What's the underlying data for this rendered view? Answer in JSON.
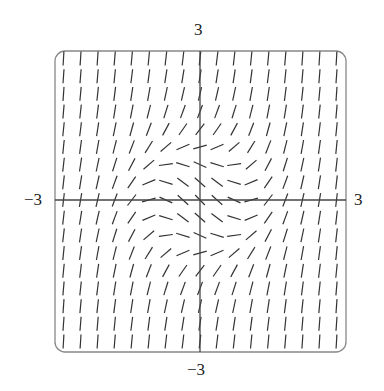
{
  "chart_data": {
    "type": "slope_field",
    "title": "",
    "equation_approx": "dy/dx = x^2 + y^2 - 1",
    "xlim": [
      -3,
      3
    ],
    "ylim": [
      -3,
      3
    ],
    "grid_size": 17,
    "tick_labels": {
      "x_min": "−3",
      "x_max": "3",
      "y_min": "−3",
      "y_max": "3"
    },
    "colors": {
      "segment": "#333333",
      "axis": "#444444",
      "frame": "#888888"
    }
  }
}
